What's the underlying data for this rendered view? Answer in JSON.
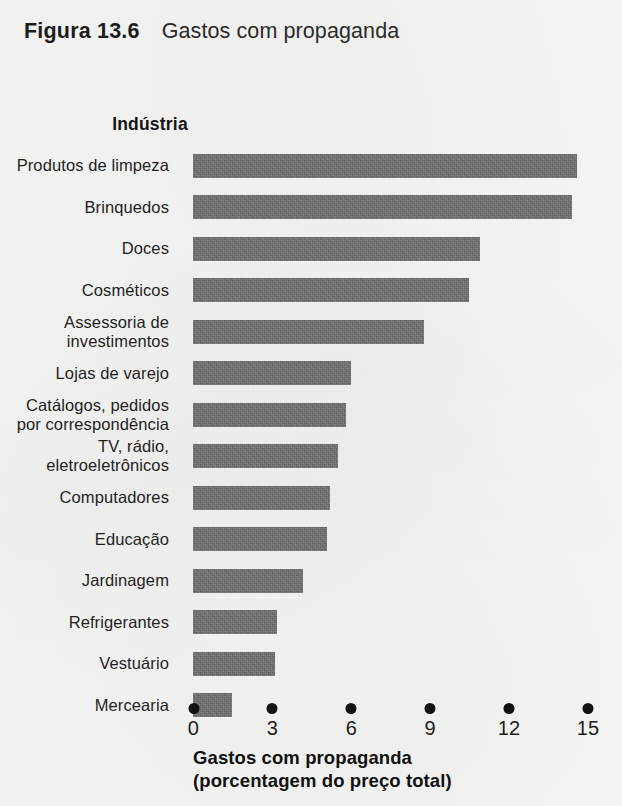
{
  "figure": {
    "label": "Figura",
    "number": "13.6",
    "caption": "Gastos com propaganda"
  },
  "category_header": "Indústria",
  "axis_title_line1": "Gastos com propaganda",
  "axis_title_line2": "(porcentagem do preço total)",
  "colors": {
    "bar": "#6f6f6f",
    "text": "#1c1c1c",
    "background": "#f6f6f5",
    "tick": "#121212"
  },
  "chart_data": {
    "type": "bar",
    "orientation": "horizontal",
    "title": "Gastos com propaganda",
    "xlabel": "Gastos com propaganda (porcentagem do preço total)",
    "ylabel": "Indústria",
    "xlim": [
      0,
      15
    ],
    "xticks": [
      0,
      3,
      6,
      9,
      12,
      15
    ],
    "xtick_labels": [
      "0",
      "3",
      "6",
      "9",
      "12",
      "15"
    ],
    "grid": false,
    "legend": false,
    "tick_style": "dots",
    "categories": [
      "Produtos de limpeza",
      "Brinquedos",
      "Doces",
      "Cosméticos",
      "Assessoria de investimentos",
      "Lojas de varejo",
      "Catálogos, pedidos por correspondência",
      "TV, rádio, eletroeletrônicos",
      "Computadores",
      "Educação",
      "Jardinagem",
      "Refrigerantes",
      "Vestuário",
      "Mercearia"
    ],
    "category_lines": [
      [
        "Produtos de limpeza"
      ],
      [
        "Brinquedos"
      ],
      [
        "Doces"
      ],
      [
        "Cosméticos"
      ],
      [
        "Assessoria de",
        "investimentos"
      ],
      [
        "Lojas de varejo"
      ],
      [
        "Catálogos, pedidos",
        "por correspondência"
      ],
      [
        "TV, rádio,",
        "eletroeletrônicos"
      ],
      [
        "Computadores"
      ],
      [
        "Educação"
      ],
      [
        "Jardinagem"
      ],
      [
        "Refrigerantes"
      ],
      [
        "Vestuário"
      ],
      [
        "Mercearia"
      ]
    ],
    "values": [
      14.6,
      14.4,
      10.9,
      10.5,
      8.8,
      6.0,
      5.8,
      5.5,
      5.2,
      5.1,
      4.2,
      3.2,
      3.1,
      1.5
    ]
  }
}
